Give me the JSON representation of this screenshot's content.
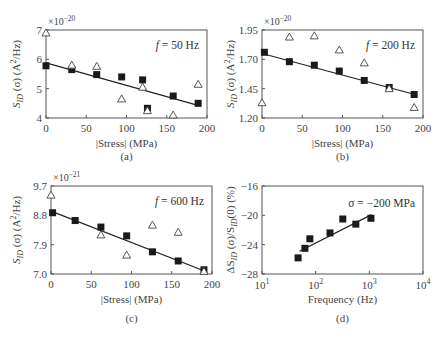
{
  "chart_data": [
    {
      "type": "scatter",
      "panel": "(a)",
      "annotation": "f = 50 Hz",
      "xlabel": "|Stress| (MPa)",
      "ylabel": "S_ID (σ) (A²/Hz)",
      "y_multiplier": "×10⁻²⁰",
      "xlim": [
        0,
        200
      ],
      "ylim": [
        4,
        7
      ],
      "xticks": [
        0,
        50,
        100,
        150,
        200
      ],
      "yticks": [
        4,
        5,
        6,
        7
      ],
      "series": [
        {
          "name": "squares",
          "marker": "filled-square",
          "x": [
            0,
            32,
            63,
            94,
            120,
            126,
            158,
            189
          ],
          "y": [
            5.78,
            5.65,
            5.48,
            5.4,
            5.3,
            4.33,
            4.75,
            4.5
          ]
        },
        {
          "name": "triangles",
          "marker": "open-triangle",
          "x": [
            0,
            32,
            63,
            94,
            120,
            126,
            158,
            189
          ],
          "y": [
            6.9,
            5.8,
            5.76,
            4.65,
            5.05,
            4.25,
            4.1,
            5.15
          ]
        },
        {
          "name": "fit",
          "marker": "line",
          "x": [
            0,
            190
          ],
          "y": [
            5.88,
            4.42
          ]
        }
      ]
    },
    {
      "type": "scatter",
      "panel": "(b)",
      "annotation": "f = 200 Hz",
      "xlabel": "|Stress| (MPa)",
      "ylabel": "S_ID (σ) (A²/Hz)",
      "y_multiplier": "×10⁻²⁰",
      "xlim": [
        0,
        200
      ],
      "ylim": [
        1.2,
        1.95
      ],
      "xticks": [
        0,
        50,
        100,
        150,
        200
      ],
      "yticks": [
        1.2,
        1.45,
        1.7,
        1.95
      ],
      "series": [
        {
          "name": "squares",
          "marker": "filled-square",
          "x": [
            3,
            34,
            65,
            96,
            127,
            158,
            189
          ],
          "y": [
            1.76,
            1.68,
            1.65,
            1.6,
            1.52,
            1.46,
            1.4
          ]
        },
        {
          "name": "triangles",
          "marker": "open-triangle",
          "x": [
            0,
            34,
            65,
            96,
            127,
            158,
            189
          ],
          "y": [
            1.33,
            1.89,
            1.9,
            1.78,
            1.67,
            1.45,
            1.29
          ]
        },
        {
          "name": "fit",
          "marker": "line",
          "x": [
            0,
            190
          ],
          "y": [
            1.75,
            1.4
          ]
        }
      ]
    },
    {
      "type": "scatter",
      "panel": "(c)",
      "annotation": "f = 600 Hz",
      "xlabel": "|Stress| (MPa)",
      "ylabel": "S_ID (σ) (A²/Hz)",
      "y_multiplier": "×10⁻²¹",
      "xlim": [
        0,
        200
      ],
      "ylim": [
        7.0,
        9.7
      ],
      "xticks": [
        0,
        50,
        100,
        150,
        200
      ],
      "yticks": [
        7.0,
        7.9,
        8.8,
        9.7
      ],
      "series": [
        {
          "name": "squares",
          "marker": "filled-square",
          "x": [
            2,
            30,
            62,
            94,
            126,
            158,
            190
          ],
          "y": [
            8.88,
            8.64,
            8.44,
            8.17,
            7.68,
            7.4,
            7.13
          ]
        },
        {
          "name": "triangles",
          "marker": "open-triangle",
          "x": [
            0,
            62,
            94,
            126,
            158,
            190
          ],
          "y": [
            9.42,
            8.2,
            7.58,
            8.5,
            8.28,
            7.08
          ]
        },
        {
          "name": "fit",
          "marker": "line",
          "x": [
            0,
            190
          ],
          "y": [
            8.93,
            7.1
          ]
        }
      ]
    },
    {
      "type": "scatter",
      "panel": "(d)",
      "annotation": "σ = −200 MPa",
      "xlabel": "Frequency (Hz)",
      "ylabel": "ΔS_ID (σ)/S_ID(0) (%)",
      "xscale": "log",
      "xlim": [
        10,
        10000
      ],
      "ylim": [
        -28,
        -16
      ],
      "xticks": [
        "10¹",
        "10²",
        "10³",
        "10⁴"
      ],
      "yticks": [
        -28,
        -24,
        -20,
        -16
      ],
      "series": [
        {
          "name": "squares",
          "marker": "filled-square",
          "x": [
            47,
            63,
            78,
            185,
            320,
            560,
            1070
          ],
          "y": [
            -25.8,
            -24.5,
            -23.2,
            -22.4,
            -20.5,
            -21.2,
            -20.4
          ]
        },
        {
          "name": "fit",
          "marker": "line",
          "x": [
            50,
            1100
          ],
          "y": [
            -24.9,
            -19.9
          ]
        }
      ]
    }
  ],
  "panels": {
    "a": {
      "caption": "(a)",
      "annotation_f": "f",
      "annotation_rest": " = 50 Hz",
      "xlabel": "|Stress| (MPa)",
      "mult_base": "×10",
      "mult_exp": "−20",
      "yticks": [
        "7",
        "6",
        "5",
        "4"
      ],
      "xticks": [
        "0",
        "50",
        "100",
        "150",
        "200"
      ]
    },
    "b": {
      "caption": "(b)",
      "annotation_f": "f",
      "annotation_rest": " = 200 Hz",
      "xlabel": "|Stress| (MPa)",
      "mult_base": "×10",
      "mult_exp": "−20",
      "yticks": [
        "1.95",
        "1.70",
        "1.45",
        "1.20"
      ],
      "xticks": [
        "0",
        "50",
        "100",
        "150",
        "200"
      ]
    },
    "c": {
      "caption": "(c)",
      "annotation_f": "f",
      "annotation_rest": " = 600 Hz",
      "xlabel": "|Stress| (MPa)",
      "mult_base": "×10",
      "mult_exp": "−21",
      "yticks": [
        "9.7",
        "8.8",
        "7.9",
        "7.0"
      ],
      "xticks": [
        "0",
        "50",
        "100",
        "150",
        "200"
      ]
    },
    "d": {
      "caption": "(d)",
      "annotation": "σ = −200 MPa",
      "xlabel": "Frequency (Hz)",
      "yticks": [
        "−16",
        "−20",
        "−24",
        "−28"
      ],
      "xticks_base": [
        "10",
        "10",
        "10",
        "10"
      ],
      "xticks_exp": [
        "1",
        "2",
        "3",
        "4"
      ]
    }
  },
  "ylabel_stress": {
    "s": "S",
    "sub": "ID",
    "rest1": " (σ) (A",
    "sup": "2",
    "rest2": "/Hz)"
  },
  "ylabel_delta": {
    "pre": "ΔS",
    "sub1": "ID",
    "mid": " (σ)/S",
    "sub2": "ID",
    "post": "(0) (%)"
  },
  "colors": {
    "axis": "#555555",
    "marker": "#1a1a1a",
    "text": "#444444"
  }
}
